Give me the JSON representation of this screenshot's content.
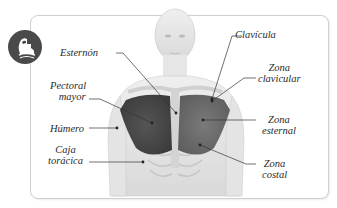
{
  "diagram": {
    "badge_icon": "flexed-arm-icon",
    "colors": {
      "badge": "#4a4a4a",
      "muscle": "#6e6e6e",
      "muscle_dark": "#4d4d4d",
      "body": "#e2e2e2",
      "frame_border": "#cfcfcf",
      "leader_line": "#333333"
    },
    "labels": {
      "esternon": "Esternón",
      "clavicula": "Clavícula",
      "pectoral_line1": "Pectoral",
      "pectoral_line2": "mayor",
      "zona_clavicular_line1": "Zona",
      "zona_clavicular_line2": "clavicular",
      "humero": "Húmero",
      "zona_esternal_line1": "Zona",
      "zona_esternal_line2": "esternal",
      "caja_line1": "Caja",
      "caja_line2": "torácica",
      "zona_costal_line1": "Zona",
      "zona_costal_line2": "costal"
    }
  }
}
